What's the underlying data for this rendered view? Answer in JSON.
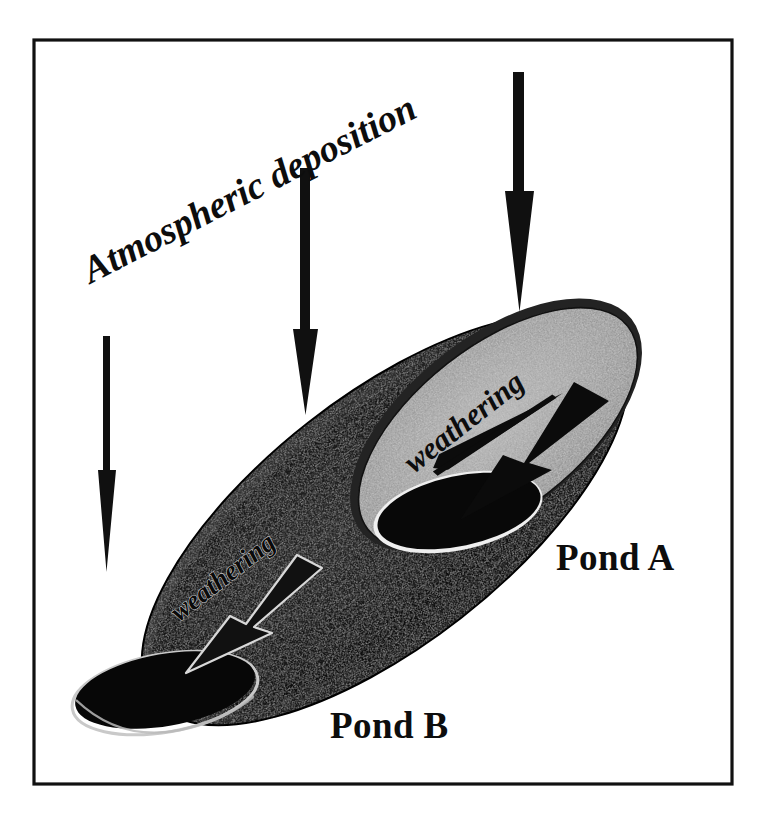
{
  "figure": {
    "kind": "schematic-diagram",
    "background_color": "#ffffff",
    "frame": {
      "name": "outer-border",
      "stroke_color": "#111111",
      "stroke_width": 3
    }
  },
  "labels": {
    "atmospheric_deposition": "Atmospheric deposition",
    "weathering_a": "weathering",
    "weathering_b": "weathering",
    "pond_a": "Pond A",
    "pond_b": "Pond B"
  },
  "deposition": {
    "label": "Atmospheric deposition",
    "rotation_deg": -27,
    "arrow_count": 3,
    "arrow_direction": "down",
    "arrows": [
      {
        "name": "deposition-arrow-left",
        "x": 106,
        "y_top": 336,
        "y_tip": 570,
        "shaft_width": 6
      },
      {
        "name": "deposition-arrow-middle",
        "x": 305,
        "y_top": 168,
        "y_tip": 412,
        "shaft_width": 8
      },
      {
        "name": "deposition-arrow-right",
        "x": 519,
        "y_top": 72,
        "y_tip": 310,
        "shaft_width": 9
      }
    ]
  },
  "ponds": [
    {
      "id": "pond-a",
      "label": "Pond A",
      "basin_fill": "#9c9c9c",
      "water_fill": "#0b0b0b",
      "rim_fill": "#3a3a3a",
      "weathering_label": "weathering",
      "weathering_arrow_direction": "down-left",
      "label_position": {
        "x": 556,
        "y": 570
      }
    },
    {
      "id": "pond-b",
      "label": "Pond B",
      "basin_fill": "#191919",
      "water_fill": "#080808",
      "rim_fill": "#2b2b2b",
      "weathering_label": "weathering",
      "weathering_arrow_direction": "down-left",
      "label_position": {
        "x": 330,
        "y": 738
      }
    }
  ],
  "colors": {
    "ink": "#111111",
    "paper": "#ffffff",
    "gray_basin": "#9c9c9c",
    "dark_basin": "#191919",
    "water_black": "#0b0b0b"
  }
}
